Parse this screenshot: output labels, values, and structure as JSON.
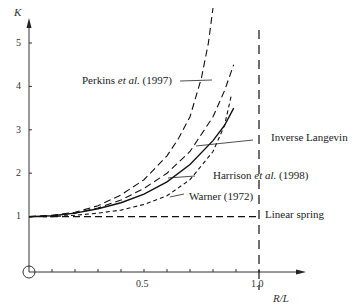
{
  "chart_data": {
    "type": "line",
    "title": "",
    "xlabel": "R/L",
    "ylabel": "K",
    "xlim": [
      0,
      1.15
    ],
    "ylim": [
      0,
      5.5
    ],
    "grid": false,
    "x_ticks": [
      "0.5",
      "1.0"
    ],
    "y_ticks": [
      "1",
      "2",
      "3",
      "4",
      "5"
    ],
    "series": [
      {
        "name": "Perkins et al. (1997)",
        "style": "long-dash",
        "x": [
          0,
          0.1,
          0.2,
          0.3,
          0.4,
          0.5,
          0.6,
          0.65,
          0.7,
          0.75,
          0.78,
          0.8
        ],
        "y": [
          1.0,
          1.03,
          1.1,
          1.25,
          1.5,
          1.85,
          2.4,
          2.8,
          3.3,
          4.2,
          5.0,
          6.0
        ]
      },
      {
        "name": "Harrison et al. (1998)",
        "style": "long-dash",
        "x": [
          0,
          0.1,
          0.2,
          0.3,
          0.4,
          0.5,
          0.6,
          0.7,
          0.8,
          0.85,
          0.89
        ],
        "y": [
          1.0,
          1.02,
          1.08,
          1.2,
          1.38,
          1.65,
          2.0,
          2.5,
          3.3,
          3.9,
          4.5
        ]
      },
      {
        "name": "Inverse Langevin",
        "style": "solid",
        "x": [
          0,
          0.1,
          0.2,
          0.3,
          0.4,
          0.5,
          0.6,
          0.7,
          0.8,
          0.85,
          0.89
        ],
        "y": [
          1.0,
          1.02,
          1.08,
          1.18,
          1.32,
          1.52,
          1.8,
          2.2,
          2.75,
          3.1,
          3.5
        ]
      },
      {
        "name": "Warner (1972)",
        "style": "short-dash",
        "x": [
          0,
          0.1,
          0.2,
          0.3,
          0.4,
          0.5,
          0.6,
          0.7,
          0.8,
          0.85,
          0.88
        ],
        "y": [
          1.0,
          1.0,
          1.03,
          1.08,
          1.15,
          1.28,
          1.48,
          1.85,
          2.5,
          3.1,
          3.8
        ]
      },
      {
        "name": "Linear spring",
        "style": "long-dash",
        "x": [
          0,
          1.0
        ],
        "y": [
          1.0,
          1.0
        ]
      }
    ],
    "annotations": [
      {
        "type": "vertical-asymptote",
        "x": 1.0,
        "style": "long-dash"
      }
    ]
  },
  "axes": {
    "ylabel": "K",
    "xlabel": "R/L",
    "x_tick_05": "0.5",
    "x_tick_10": "1.0",
    "y_ticks": [
      "1",
      "2",
      "3",
      "4",
      "5"
    ]
  },
  "labels": {
    "perkins_a": "Perkins ",
    "perkins_it": "et al.",
    "perkins_b": " (1997)",
    "inverse": "Inverse Langevin",
    "harrison_a": "Harrison ",
    "harrison_it": "et al.",
    "harrison_b": " (1998)",
    "warner": "Warner (1972)",
    "linear": "Linear spring"
  }
}
